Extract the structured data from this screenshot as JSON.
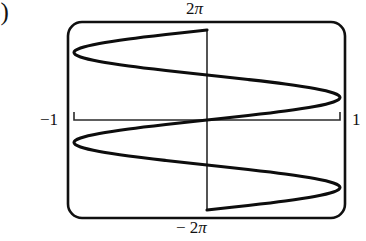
{
  "figure": {
    "part_label": "b)",
    "labels": {
      "top": {
        "num": "2",
        "pi": "π"
      },
      "bottom": {
        "num": "− 2",
        "pi": "π"
      },
      "left": "−1",
      "right": "1"
    }
  },
  "chart_data": {
    "type": "line",
    "title": "",
    "subtitle": "",
    "xlabel": "",
    "ylabel": "",
    "xlim": [
      -1,
      1
    ],
    "ylim": [
      -6.283185,
      6.283185
    ],
    "xticks": [
      -1,
      1
    ],
    "xticklabels": [
      "−1",
      "1"
    ],
    "yticks": [
      -6.283185,
      6.283185
    ],
    "yticklabels": [
      "− 2π",
      "2π"
    ],
    "grid": false,
    "legend": null,
    "axes_style": "graphing-calculator-viewport",
    "series": [
      {
        "name": "x = sin(y)",
        "points": [
          {
            "x": 0.0,
            "y": 6.283185
          },
          {
            "x": -0.309,
            "y": 5.969
          },
          {
            "x": -0.588,
            "y": 5.655
          },
          {
            "x": -0.809,
            "y": 5.341
          },
          {
            "x": -0.951,
            "y": 5.027
          },
          {
            "x": -1.0,
            "y": 4.712
          },
          {
            "x": -0.951,
            "y": 4.398
          },
          {
            "x": -0.809,
            "y": 4.084
          },
          {
            "x": -0.588,
            "y": 3.77
          },
          {
            "x": -0.309,
            "y": 3.456
          },
          {
            "x": 0.0,
            "y": 3.142
          },
          {
            "x": 0.309,
            "y": 2.827
          },
          {
            "x": 0.588,
            "y": 2.513
          },
          {
            "x": 0.809,
            "y": 2.199
          },
          {
            "x": 0.951,
            "y": 1.885
          },
          {
            "x": 1.0,
            "y": 1.571
          },
          {
            "x": 0.951,
            "y": 1.257
          },
          {
            "x": 0.809,
            "y": 0.942
          },
          {
            "x": 0.588,
            "y": 0.628
          },
          {
            "x": 0.309,
            "y": 0.314
          },
          {
            "x": 0.0,
            "y": 0.0
          },
          {
            "x": -0.309,
            "y": -0.314
          },
          {
            "x": -0.588,
            "y": -0.628
          },
          {
            "x": -0.809,
            "y": -0.942
          },
          {
            "x": -0.951,
            "y": -1.257
          },
          {
            "x": -1.0,
            "y": -1.571
          },
          {
            "x": -0.951,
            "y": -1.885
          },
          {
            "x": -0.809,
            "y": -2.199
          },
          {
            "x": -0.588,
            "y": -2.513
          },
          {
            "x": -0.309,
            "y": -2.827
          },
          {
            "x": 0.0,
            "y": -3.142
          },
          {
            "x": 0.309,
            "y": -3.456
          },
          {
            "x": 0.588,
            "y": -3.77
          },
          {
            "x": 0.809,
            "y": -4.084
          },
          {
            "x": 0.951,
            "y": -4.398
          },
          {
            "x": 1.0,
            "y": -4.712
          },
          {
            "x": 0.951,
            "y": -5.027
          },
          {
            "x": 0.809,
            "y": -5.341
          },
          {
            "x": 0.588,
            "y": -5.655
          },
          {
            "x": 0.309,
            "y": -5.969
          },
          {
            "x": 0.0,
            "y": -6.283185
          }
        ]
      }
    ]
  },
  "geometry": {
    "viewport": {
      "x": 68,
      "y": 22,
      "width": 277,
      "height": 196,
      "radius": 14
    },
    "plot": {
      "left": 74,
      "right": 340,
      "top": 30,
      "bottom": 210,
      "cx": 208,
      "cy": 120
    },
    "tick_height": 8
  },
  "colors": {
    "background": "#ffffff",
    "curve": "#0d0d0d",
    "border": "#101010",
    "axis": "#2a2a2a",
    "text": "#111111"
  }
}
